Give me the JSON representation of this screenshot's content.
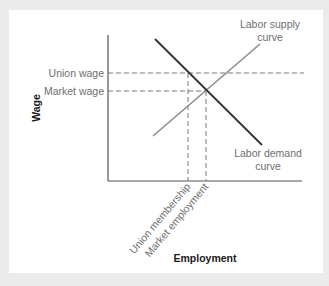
{
  "diagram": {
    "type": "labor-market-union-wage",
    "axes": {
      "x_label": "Employment",
      "y_label": "Wage"
    },
    "y_levels": [
      {
        "id": "union_wage",
        "label": "Union wage"
      },
      {
        "id": "market_wage",
        "label": "Market wage"
      }
    ],
    "x_levels": [
      {
        "id": "union_membership",
        "label": "Union membership"
      },
      {
        "id": "market_employment",
        "label": "Market employment"
      }
    ],
    "curves": {
      "supply": {
        "label_line1": "Labor supply",
        "label_line2": "curve"
      },
      "demand": {
        "label_line1": "Labor demand",
        "label_line2": "curve"
      }
    },
    "colors": {
      "background": "#ebebeb",
      "panel": "#ffffff",
      "demand_line": "#333333",
      "supply_line": "#8c8c8c",
      "axis": "#555555",
      "dashed": "#777777",
      "label_text": "#6e6e6e",
      "axis_title": "#1a1a1a"
    }
  }
}
